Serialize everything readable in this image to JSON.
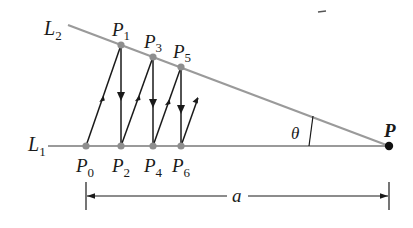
{
  "figure": {
    "lines": [
      {
        "id": "L1",
        "label": "L",
        "subscript": "1"
      },
      {
        "id": "L2",
        "label": "L",
        "subscript": "2"
      }
    ],
    "vertex": {
      "label": "P"
    },
    "angle": {
      "label": "θ"
    },
    "dimension": {
      "label": "a"
    },
    "points_upper": [
      {
        "label": "P",
        "subscript": "1"
      },
      {
        "label": "P",
        "subscript": "3"
      },
      {
        "label": "P",
        "subscript": "5"
      }
    ],
    "points_lower": [
      {
        "label": "P",
        "subscript": "0"
      },
      {
        "label": "P",
        "subscript": "2"
      },
      {
        "label": "P",
        "subscript": "4"
      },
      {
        "label": "P",
        "subscript": "6"
      }
    ],
    "colors": {
      "line_gray": "#9a9a9a",
      "point_gray": "#8e8e8e",
      "ink": "#1a1a1a"
    }
  }
}
